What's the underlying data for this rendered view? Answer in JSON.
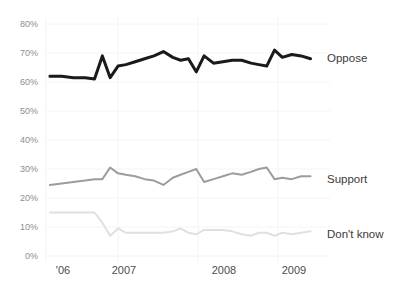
{
  "chart_data": {
    "type": "line",
    "title": "",
    "subtitle": "",
    "xlabel": "",
    "ylabel": "",
    "ylim": [
      0,
      80
    ],
    "xlim": [
      2006.0,
      2009.45
    ],
    "grid": true,
    "legend_position": "right-inline",
    "y_ticks": [
      "0%",
      "10%",
      "20%",
      "30%",
      "40%",
      "50%",
      "60%",
      "70%",
      "80%"
    ],
    "y_tick_values": [
      0,
      10,
      20,
      30,
      40,
      50,
      60,
      70,
      80
    ],
    "x_ticks": [
      "'06",
      "2007",
      "2008",
      "2009"
    ],
    "x_tick_values": [
      2006.1,
      2007.0,
      2008.0,
      2009.0
    ],
    "x": [
      2006.05,
      2006.2,
      2006.35,
      2006.5,
      2006.62,
      2006.72,
      2006.82,
      2006.92,
      2007.02,
      2007.14,
      2007.26,
      2007.38,
      2007.5,
      2007.62,
      2007.72,
      2007.82,
      2007.92,
      2008.02,
      2008.14,
      2008.26,
      2008.38,
      2008.5,
      2008.62,
      2008.72,
      2008.82,
      2008.92,
      2009.02,
      2009.14,
      2009.26,
      2009.38
    ],
    "series": [
      {
        "name": "Oppose",
        "color": "#1a1a1a",
        "width": 3.0,
        "values": [
          62,
          62,
          61.5,
          61.5,
          61,
          69,
          61.5,
          65.5,
          66,
          67,
          68,
          69,
          70.5,
          68.5,
          67.5,
          68,
          63.5,
          69,
          66.5,
          67,
          67.5,
          67.5,
          66.5,
          66,
          65.5,
          71,
          68.5,
          69.5,
          69,
          68
        ]
      },
      {
        "name": "Support",
        "color": "#9c9c9c",
        "width": 2.0,
        "values": [
          24.5,
          25,
          25.5,
          26,
          26.5,
          26.5,
          30.5,
          28.5,
          28,
          27.5,
          26.5,
          26,
          24.5,
          27,
          28,
          29,
          30,
          25.5,
          26.5,
          27.5,
          28.5,
          28,
          29,
          30,
          30.5,
          26.5,
          27,
          26.5,
          27.5,
          27.5
        ]
      },
      {
        "name": "Don't know",
        "color": "#e0e0e0",
        "width": 2.0,
        "values": [
          15,
          15,
          15,
          15,
          15,
          11.5,
          7,
          9.5,
          8,
          8,
          8,
          8,
          8,
          8.5,
          9.5,
          8,
          7.5,
          9,
          9,
          9,
          8.5,
          7.5,
          7,
          8,
          8,
          7,
          8,
          7.5,
          8,
          8.5
        ]
      }
    ],
    "annotations": []
  },
  "legend": {
    "oppose": "Oppose",
    "support": "Support",
    "dont_know": "Don't know"
  },
  "colors": {
    "oppose": "#1a1a1a",
    "support": "#9c9c9c",
    "dont_know": "#e0e0e0",
    "grid": "#f2f2f2",
    "tick_text": "#8d8d8d",
    "axis_text": "#4d4d4d",
    "background": "#ffffff"
  }
}
